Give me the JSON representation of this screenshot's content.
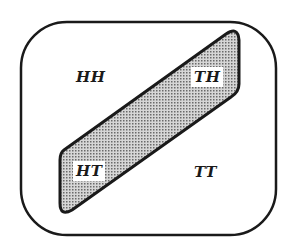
{
  "diagram": {
    "type": "venn-sample-space",
    "sample_space": {
      "shape": "rounded-rectangle",
      "stroke_color": "#1a1a1a"
    },
    "event_region": {
      "shape": "slanted-parallelogram",
      "fill_pattern": "dotted-gray",
      "fill_color": "#b8b8b8",
      "stroke_color": "#1a1a1a"
    },
    "outcomes": [
      {
        "label": "HH",
        "in_event": false
      },
      {
        "label": "TH",
        "in_event": true
      },
      {
        "label": "HT",
        "in_event": true
      },
      {
        "label": "TT",
        "in_event": false
      }
    ]
  }
}
